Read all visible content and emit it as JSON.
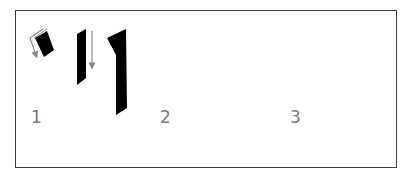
{
  "diagram": {
    "colors": {
      "ink": "#000000",
      "arrow": "#8a8a8a",
      "border": "#3a3a3a",
      "label": "#7a7a7a"
    },
    "steps": [
      {
        "label": "1",
        "strokes": [
          "angled-dab-with-bent-arrow",
          "vertical-stroke-with-down-arrow",
          "final-hooked-stroke"
        ]
      },
      {
        "label": "2",
        "strokes": [
          "curved-dab-with-up-arrow",
          "vertical-stroke-with-down-arrow",
          "final-rounded-stroke"
        ]
      },
      {
        "label": "3",
        "strokes": [
          "s-curve-stroke-with-curved-arrow",
          "vertical-stroke-with-down-arrow",
          "final-rounded-stroke"
        ]
      }
    ]
  }
}
